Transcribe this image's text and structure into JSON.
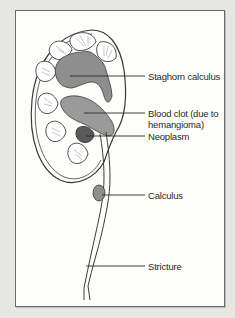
{
  "figure": {
    "type": "anatomical-diagram",
    "labels": [
      {
        "id": "staghorn",
        "text": "Staghorn calculus"
      },
      {
        "id": "blood-clot-1",
        "text": "Blood clot (due to"
      },
      {
        "id": "blood-clot-2",
        "text": "hemangioma)"
      },
      {
        "id": "neoplasm",
        "text": "Neoplasm"
      },
      {
        "id": "calculus",
        "text": "Calculus"
      },
      {
        "id": "stricture",
        "text": "Stricture"
      }
    ],
    "colors": {
      "background": "#e6e6e4",
      "panel": "#fdfdfb",
      "outline": "#3a3a3a",
      "fill": "#8e8e8e",
      "dark_fill": "#5a5a5a"
    }
  }
}
